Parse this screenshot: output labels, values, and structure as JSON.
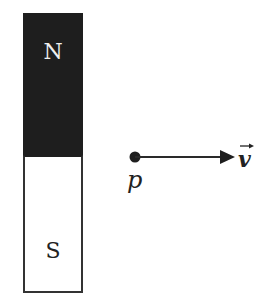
{
  "diagram": {
    "magnet": {
      "north_label": "N",
      "south_label": "S",
      "north_color": "#1e1e1e",
      "south_color": "#ffffff"
    },
    "particle": {
      "label": "p"
    },
    "velocity": {
      "label": "v",
      "vector_arrow": "→"
    }
  }
}
